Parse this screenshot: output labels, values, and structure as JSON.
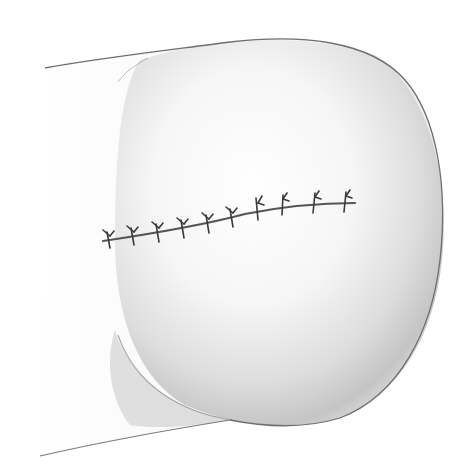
{
  "illustration": {
    "subject": "Sutured incision on rounded tissue",
    "style": "pencil shading",
    "colors": {
      "background": "#ffffff",
      "outline": "#6e6e6e",
      "shadow": "#9a9a9a",
      "suture": "#3a3a3a"
    },
    "suture_count": 10,
    "incision": {
      "start": [
        103,
        241
      ],
      "end": [
        355,
        203
      ]
    },
    "sutures": [
      {
        "x": 107,
        "y": 240
      },
      {
        "x": 131,
        "y": 236
      },
      {
        "x": 156,
        "y": 233
      },
      {
        "x": 181,
        "y": 229
      },
      {
        "x": 206,
        "y": 225
      },
      {
        "x": 230,
        "y": 220
      },
      {
        "x": 258,
        "y": 211
      },
      {
        "x": 283,
        "y": 207
      },
      {
        "x": 315,
        "y": 205
      },
      {
        "x": 346,
        "y": 204
      }
    ]
  }
}
